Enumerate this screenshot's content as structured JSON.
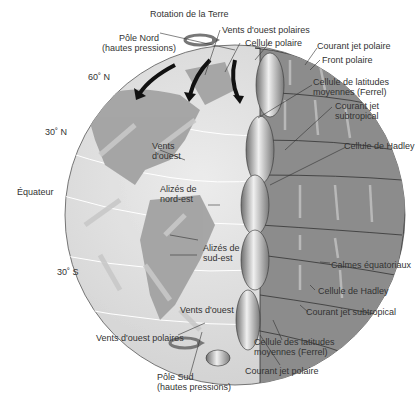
{
  "diagram": {
    "type": "atmospheric circulation globe",
    "labels": {
      "rotation": "Rotation de la Terre",
      "north_pole_1": "Pôle Nord",
      "north_pole_2": "(hautes pressions)",
      "polar_easterlies_n": "Vents d'ouest polaires",
      "polar_cell_n": "Cellule polaire",
      "polar_jet_n": "Courant jet polaire",
      "polar_front": "Front polaire",
      "ferrel_n_1": "Cellule de latitudes",
      "ferrel_n_2": "moyennes (Ferrel)",
      "subtropical_jet_n_1": "Courant jet",
      "subtropical_jet_n_2": "subtropical",
      "hadley_n": "Cellule de Hadley",
      "lat_60n": "60˚ N",
      "lat_30n": "30˚ N",
      "equator": "Équateur",
      "lat_30s": "30˚ S",
      "westerlies_n_1": "Vents",
      "westerlies_n_2": "d'ouest",
      "ne_trades_1": "Alizés de",
      "ne_trades_2": "nord-est",
      "se_trades_1": "Alizés de",
      "se_trades_2": "sud-est",
      "doldrums": "Calmes équatoriaux",
      "hadley_s": "Cellule de Hadley",
      "subtropical_jet_s": "Courant jet subtropical",
      "westerlies_s": "Vents d'ouest",
      "polar_easterlies_s": "Vents d'ouest polaires",
      "ferrel_s_1": "Cellule des latitudes",
      "ferrel_s_2": "moyennes (Ferrel)",
      "polar_jet_s": "Courant jet polaire",
      "south_pole_1": "Pôle Sud",
      "south_pole_2": "(hautes pressions)"
    },
    "colors": {
      "ocean": "#d9d9d9",
      "land": "#a6a6a6",
      "cells": "#8c8c8c",
      "arrows_light": "#c8c8c8",
      "arrows_dark": "#111111"
    }
  }
}
